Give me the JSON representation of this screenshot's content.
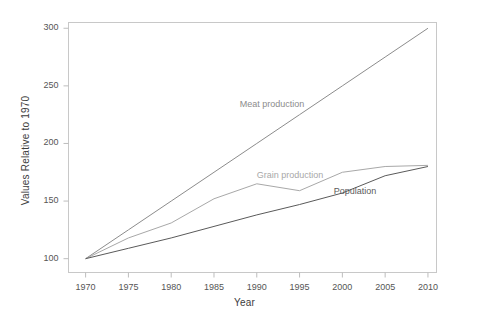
{
  "chart_data": {
    "type": "line",
    "title": "",
    "xlabel": "Year",
    "ylabel": "Values Relative to 1970",
    "xlim": [
      1968,
      2011
    ],
    "ylim": [
      88,
      305
    ],
    "grid": false,
    "legend_position": "inline-annotations",
    "xticks": [
      1970,
      1975,
      1980,
      1985,
      1990,
      1995,
      2000,
      2005,
      2010
    ],
    "yticks": [
      100,
      150,
      200,
      250,
      300
    ],
    "x": [
      1970,
      1975,
      1980,
      1985,
      1990,
      1995,
      2000,
      2005,
      2010
    ],
    "series": [
      {
        "name": "Meat production",
        "color": "#8c8c8c",
        "label_x": 1988,
        "label_y": 233,
        "values": [
          100,
          125,
          150,
          175,
          200,
          225,
          250,
          275,
          300
        ]
      },
      {
        "name": "Grain production",
        "color": "#a8a8a8",
        "label_x": 1990,
        "label_y": 172,
        "values": [
          100,
          118,
          131,
          152,
          165,
          159,
          175,
          180,
          181
        ]
      },
      {
        "name": "Population",
        "color": "#5a5a5a",
        "label_x": 1999,
        "label_y": 158,
        "values": [
          100,
          109,
          118,
          128,
          138,
          147,
          157,
          172,
          180
        ]
      }
    ]
  },
  "colors": {
    "frame": "#c8c8c8",
    "tick": "#bdbdbd",
    "tick_text": "#555555",
    "axis_title": "#3c3c3c",
    "background": "#ffffff"
  }
}
